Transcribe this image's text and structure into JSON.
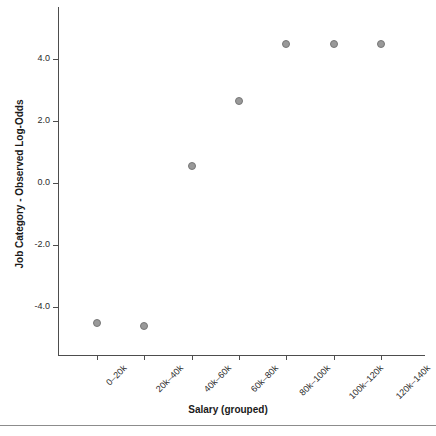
{
  "chart_data": {
    "type": "scatter",
    "title": "",
    "xlabel": "Salary (grouped)",
    "ylabel": "Job Category - Observed Log-Odds",
    "categories": [
      "0–20k",
      "20k–40k",
      "40k–60k",
      "60k–80k",
      "80k–100k",
      "100k–120k",
      "120k–140k"
    ],
    "values": [
      -4.5,
      -4.6,
      0.55,
      2.65,
      4.5,
      4.5,
      4.5
    ],
    "series": [
      {
        "name": "Observed Log-Odds",
        "points": [
          {
            "x": "0–20k",
            "y": -4.5
          },
          {
            "x": "20k–40k",
            "y": -4.6
          },
          {
            "x": "40k–60k",
            "y": 0.55
          },
          {
            "x": "60k–80k",
            "y": 2.65
          },
          {
            "x": "80k–100k",
            "y": 4.5
          },
          {
            "x": "100k–120k",
            "y": 4.5
          },
          {
            "x": "120k–140k",
            "y": 4.5
          }
        ]
      }
    ],
    "ytick_labels": [
      "4.0",
      "2.0",
      "0.0",
      "-2.0",
      "-4.0"
    ],
    "ytick_values": [
      4.0,
      2.0,
      0.0,
      -2.0,
      -4.0
    ],
    "ylim": [
      -5.65,
      4.8
    ],
    "xlim": [
      0,
      8
    ],
    "grid": false,
    "legend": false,
    "marker_color": "#999999",
    "marker_edge_color": "#777777",
    "axis_color": "#4d4d4d",
    "background": "#ffffff"
  }
}
